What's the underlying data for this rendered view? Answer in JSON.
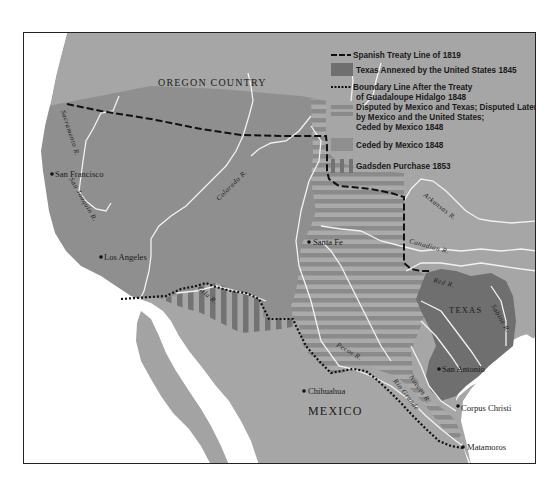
{
  "map": {
    "colors": {
      "sea": "#ffffff",
      "us_territory": "#a6a6a6",
      "ceded_1848": "#8e8e8e",
      "texas_1845": "#6f6f6f",
      "disputed_stripe_dark": "#8a8a8a",
      "disputed_stripe_light": "#a9a9a9",
      "gadsden_stripe": "#6f6f6f",
      "mexico": "#a3a3a3",
      "river": "#f4f4f4",
      "border": "#111111"
    },
    "legend": {
      "items": [
        {
          "symbol": "dashed-line",
          "label": "Spanish Treaty Line of 1819"
        },
        {
          "symbol": "dark-fill",
          "label": "Texas Annexed by the United States 1845"
        },
        {
          "symbol": "dotted-line",
          "label_line1": "Boundary Line After the Treaty",
          "label_line2": "of Guadaloupe Hidalgo 1848"
        },
        {
          "symbol": "horizontal-stripes",
          "label_line1": "Disputed by Mexico and Texas; Disputed Later",
          "label_line2": "by Mexico and the United States;",
          "label_line3": "Ceded by Mexico 1848"
        },
        {
          "symbol": "medium-fill",
          "label": "Ceded by Mexico 1848"
        },
        {
          "symbol": "vertical-stripes",
          "label": "Gadsden Purchase 1853"
        }
      ]
    },
    "regions": {
      "oregon": "OREGON COUNTRY",
      "texas": "TEXAS",
      "mexico": "MEXICO"
    },
    "cities": [
      {
        "name": "San Francisco"
      },
      {
        "name": "Los Angeles"
      },
      {
        "name": "Santa Fe"
      },
      {
        "name": "San Antonio"
      },
      {
        "name": "Chihuahua"
      },
      {
        "name": "Corpus Christi"
      },
      {
        "name": "Matamoros"
      }
    ],
    "rivers": {
      "sacramento": "Sacramento R.",
      "san_joaquin": "San Joaquin R.",
      "colorado": "Colorado R.",
      "gila": "Gila R.",
      "arkansas": "Arkansas R.",
      "canadian": "Canadian R.",
      "red": "Red R.",
      "sabine": "Sabine R.",
      "pecos": "Pecos R.",
      "nueces": "Nueces R.",
      "rio_grande": "Rio Grande"
    }
  }
}
